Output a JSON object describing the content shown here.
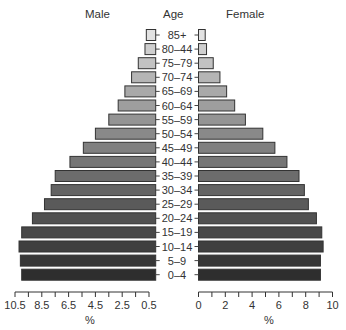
{
  "chart_data": {
    "type": "bar",
    "subtype": "population-pyramid",
    "title": "",
    "center_label": "Age",
    "left_label": "Male",
    "right_label": "Female",
    "xlabel_left": "%",
    "xlabel_right": "%",
    "categories": [
      "85+",
      "80–44",
      "75–79",
      "70–74",
      "65–69",
      "60–64",
      "55–59",
      "50–54",
      "45–49",
      "40–44",
      "35–39",
      "30–34",
      "25–29",
      "20–24",
      "15–19",
      "10–14",
      "5–9",
      "0–4"
    ],
    "series": [
      {
        "name": "Male",
        "values": [
          0.7,
          0.8,
          1.3,
          1.8,
          2.3,
          2.8,
          3.5,
          4.5,
          5.4,
          6.4,
          7.5,
          7.8,
          8.3,
          9.2,
          10.0,
          10.2,
          10.1,
          10.0
        ]
      },
      {
        "name": "Female",
        "values": [
          0.5,
          0.6,
          1.1,
          1.6,
          2.1,
          2.7,
          3.5,
          4.8,
          5.7,
          6.6,
          7.5,
          7.9,
          8.2,
          8.8,
          9.2,
          9.3,
          9.1,
          9.1
        ]
      }
    ],
    "male_axis": {
      "ticks": [
        "10.5",
        "8.5",
        "6.5",
        "4.5",
        "2.5",
        "0.5"
      ],
      "range": [
        10.5,
        0.5
      ]
    },
    "female_axis": {
      "ticks": [
        "0",
        "2",
        "4",
        "6",
        "8",
        "10"
      ],
      "range": [
        0,
        10
      ]
    },
    "grid": false,
    "bar_colors": {
      "top": "#e2e2e2",
      "bottom": "#2e2e2e",
      "border": "#333333"
    }
  }
}
